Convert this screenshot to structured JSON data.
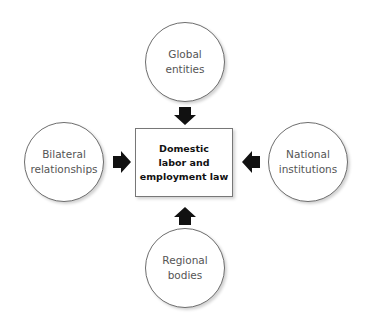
{
  "diagram": {
    "center": {
      "label": "Domestic\nlabor and\nemployment law"
    },
    "nodes": [
      {
        "id": "top",
        "label": "Global\nentities",
        "arrow_direction": "down"
      },
      {
        "id": "left",
        "label": "Bilateral\nrelationships",
        "arrow_direction": "right"
      },
      {
        "id": "right",
        "label": "National\ninstitutions",
        "arrow_direction": "left"
      },
      {
        "id": "bottom",
        "label": "Regional\nbodies",
        "arrow_direction": "up"
      }
    ],
    "colors": {
      "arrow": "#111111",
      "circle_border": "#6e6e6e",
      "text": "#555555"
    }
  }
}
